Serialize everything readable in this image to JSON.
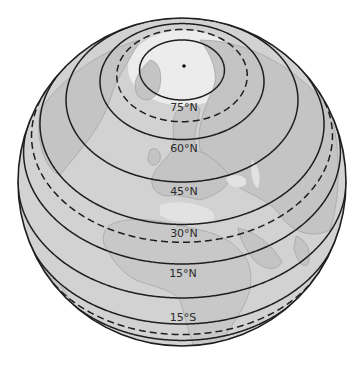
{
  "figure": {
    "type": "orthographic-globe",
    "view_center_latitude": 45,
    "colors": {
      "background": "#ffffff",
      "ocean": "#d2d2d2",
      "land": "#c4c4c4",
      "arctic_ice": "#ececec",
      "outline": "#1e1e1e",
      "line": "#1e1e1e",
      "coast": "#9a9a9a"
    },
    "north_pole_marker": "dot"
  },
  "latitude_lines": [
    {
      "lat": 75,
      "style": "solid",
      "label": "75°N"
    },
    {
      "lat": 66.56,
      "style": "dashed",
      "label": ""
    },
    {
      "lat": 60,
      "style": "solid",
      "label": "60°N"
    },
    {
      "lat": 45,
      "style": "solid",
      "label": "45°N"
    },
    {
      "lat": 30,
      "style": "solid",
      "label": "30°N"
    },
    {
      "lat": 23.44,
      "style": "dashed",
      "label": ""
    },
    {
      "lat": 15,
      "style": "solid",
      "label": "15°N"
    },
    {
      "lat": 0,
      "style": "solid",
      "label": ""
    },
    {
      "lat": -15,
      "style": "solid",
      "label": "15°S"
    },
    {
      "lat": -23.44,
      "style": "dashed",
      "label": ""
    },
    {
      "lat": -30,
      "style": "solid",
      "label": ""
    }
  ],
  "labels": {
    "lat75": "75°N",
    "lat60": "60°N",
    "lat45": "45°N",
    "lat30": "30°N",
    "lat15n": "15°N",
    "lat15s": "15°S"
  }
}
